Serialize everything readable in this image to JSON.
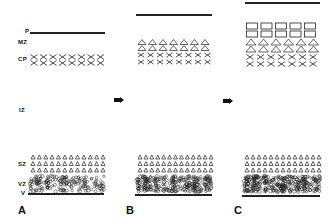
{
  "diagram": {
    "zone_labels": {
      "p": "P",
      "mz": "MZ",
      "cp": "CP",
      "iz": "IZ",
      "sz": "SZ",
      "vz": "VZ",
      "v": "V"
    },
    "panels": [
      {
        "label": "A",
        "stage": "early",
        "cp_rows": [
          "cross",
          "cross"
        ]
      },
      {
        "label": "B",
        "stage": "middle",
        "cp_rows": [
          "triangle-large",
          "triangle-large",
          "cross",
          "cross"
        ]
      },
      {
        "label": "C",
        "stage": "late",
        "cp_rows": [
          "rectangle",
          "rectangle",
          "triangle-large",
          "triangle-large",
          "cross",
          "cross"
        ]
      }
    ],
    "arrows": [
      "arrow-A-to-B",
      "arrow-B-to-C"
    ],
    "colors": {
      "ink": "#222222",
      "background": "#ffffff"
    }
  }
}
